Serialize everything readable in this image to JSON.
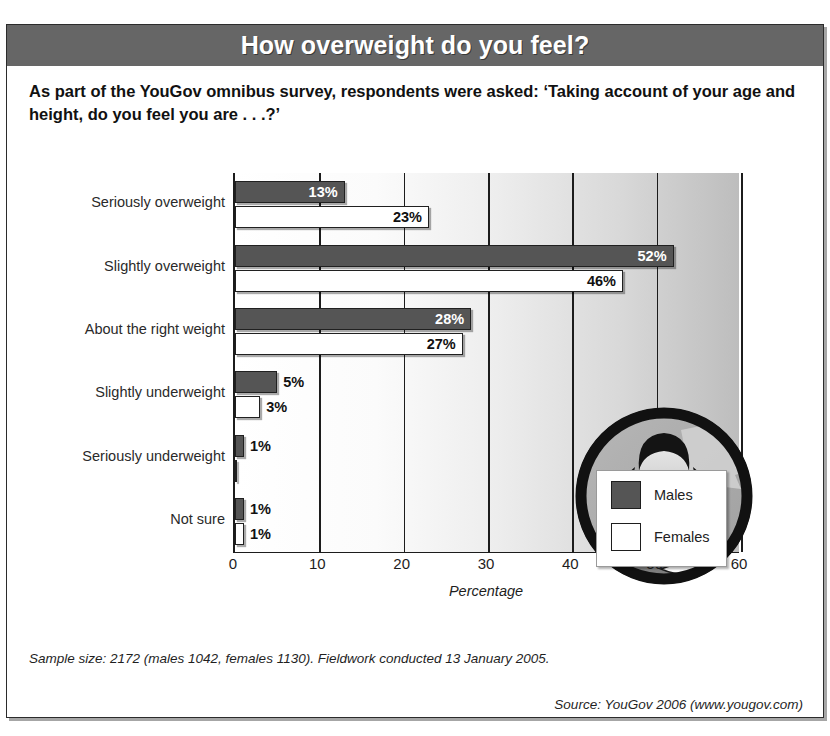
{
  "title": "How overweight do you feel?",
  "subtitle": "As part of the YouGov omnibus survey, respondents were asked: ‘Taking account of your age and height, do you feel you are . . .?’",
  "footnote": "Sample size: 2172 (males 1042, females 1130). Fieldwork conducted 13 January 2005.",
  "source": "Source: YouGov 2006 (www.yougov.com)",
  "colors": {
    "title_band": "#666666",
    "males_bar": "#555555",
    "females_bar": "#ffffff",
    "bar_outline": "#202020",
    "frame": "#2b2b2b"
  },
  "legend": {
    "position": "inside-right",
    "entries": [
      {
        "label": "Males",
        "swatch": "males-swatch"
      },
      {
        "label": "Females",
        "swatch": "females-swatch"
      }
    ]
  },
  "illustration": {
    "name": "woman-measuring-waist-illustration"
  },
  "chart_data": {
    "type": "bar",
    "orientation": "horizontal",
    "title": "How overweight do you feel?",
    "xlabel": "Percentage",
    "ylabel": "",
    "xlim": [
      0,
      60
    ],
    "xticks": [
      0,
      10,
      20,
      30,
      40,
      50,
      60
    ],
    "xtick_labels": [
      "0",
      "10",
      "20",
      "30",
      "40",
      "50",
      "60"
    ],
    "grid": true,
    "categories": [
      "Seriously overweight",
      "Slightly overweight",
      "About the right weight",
      "Slightly underweight",
      "Seriously underweight",
      "Not sure"
    ],
    "series": [
      {
        "name": "Males",
        "values": [
          13,
          52,
          28,
          5,
          1,
          1
        ],
        "labels": [
          "13%",
          "52%",
          "28%",
          "5%",
          "1%",
          "1%"
        ]
      },
      {
        "name": "Females",
        "values": [
          23,
          46,
          27,
          3,
          0,
          1
        ],
        "labels": [
          "23%",
          "46%",
          "27%",
          "3%",
          "",
          "1%"
        ]
      }
    ]
  }
}
